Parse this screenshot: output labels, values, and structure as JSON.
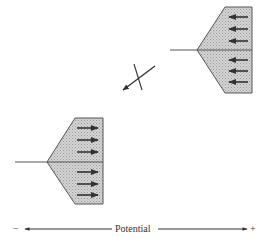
{
  "diagram": {
    "type": "electrode double-layer / ion orientation schematic",
    "colors": {
      "stroke": "#555555",
      "fill": "#c8c8c8",
      "arrow": "#333333",
      "text": "#333333"
    },
    "upper_shape": {
      "position": "upper-right",
      "arrow_direction": "left",
      "arrow_count": 6
    },
    "lower_shape": {
      "position": "lower-left",
      "arrow_direction": "right",
      "arrow_count": 6
    },
    "center_symbol": {
      "description": "crossed-out arrow pointing down-left"
    },
    "axis": {
      "label": "Potential",
      "minus_label": "−",
      "plus_label": "+"
    }
  }
}
